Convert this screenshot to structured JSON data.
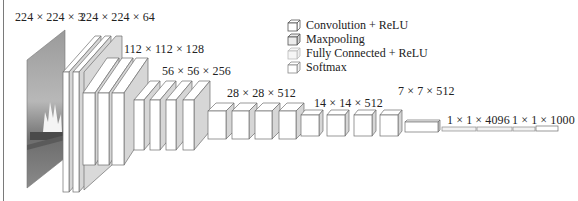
{
  "diagram": {
    "layer_dimensions": [
      {
        "id": "input",
        "label": "224 × 224 × 3",
        "type": "input"
      },
      {
        "id": "conv1",
        "label": "224 × 224 × 64",
        "type": "convolution"
      },
      {
        "id": "conv2",
        "label": "112 × 112 × 128",
        "type": "convolution"
      },
      {
        "id": "conv3",
        "label": "56 × 56 × 256",
        "type": "convolution"
      },
      {
        "id": "conv4",
        "label": "28 × 28 × 512",
        "type": "convolution"
      },
      {
        "id": "conv5",
        "label": "14 × 14 × 512",
        "type": "convolution"
      },
      {
        "id": "pool5",
        "label": "7 × 7 × 512",
        "type": "maxpooling"
      },
      {
        "id": "fc",
        "label": "1 × 1 × 4096",
        "type": "fully_connected"
      },
      {
        "id": "softmax",
        "label": "1 × 1 × 1000",
        "type": "softmax"
      }
    ],
    "legend": [
      {
        "label": "Convolution + ReLU",
        "icon": "cube-white-icon",
        "color": "#ffffff"
      },
      {
        "label": "Maxpooling",
        "icon": "cube-gray-icon",
        "color": "#d9d9d9"
      },
      {
        "label": "Fully Connected + ReLU",
        "icon": "cube-light-icon",
        "color": "#f2f2f2"
      },
      {
        "label": "Softmax",
        "icon": "cube-outline-icon",
        "color": "#ffffff"
      }
    ],
    "colors": {
      "face_front": "#ffffff",
      "face_side": "#d6d6d6",
      "face_top": "#ffffff",
      "stroke": "#6e6e6e",
      "image_tint": "#8a8a8a"
    }
  }
}
